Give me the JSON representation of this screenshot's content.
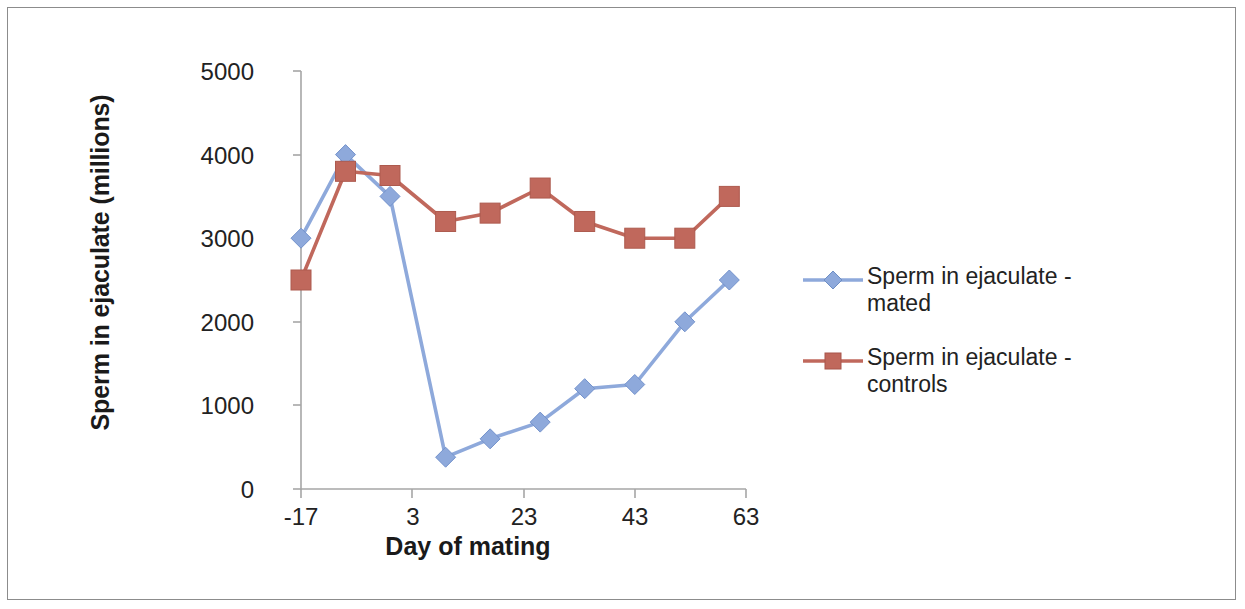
{
  "chart_data": {
    "type": "line",
    "title": "",
    "xlabel": "Day of mating",
    "ylabel": "Sperm in ejaculate (millions)",
    "xlim": [
      -17,
      63
    ],
    "ylim": [
      0,
      5000
    ],
    "xticks": [
      "-17",
      "3",
      "23",
      "43",
      "63"
    ],
    "xtick_values": [
      -17,
      3,
      23,
      43,
      63
    ],
    "yticks": [
      "0",
      "1000",
      "2000",
      "3000",
      "4000",
      "5000"
    ],
    "ytick_values": [
      0,
      1000,
      2000,
      3000,
      4000,
      5000
    ],
    "grid": false,
    "legend_position": "right",
    "series": [
      {
        "name": "Sperm in ejaculate  -  mated",
        "color": "#8ea9db",
        "marker": "diamond",
        "x": [
          -17,
          -9,
          -1,
          9,
          17,
          26,
          34,
          43,
          52,
          60
        ],
        "values": [
          3000,
          4000,
          3500,
          380,
          600,
          800,
          1200,
          1250,
          2000,
          2500
        ]
      },
      {
        "name": "Sperm in ejaculate  -  controls",
        "color": "#c0685c",
        "marker": "square",
        "x": [
          -17,
          -9,
          -1,
          9,
          17,
          26,
          34,
          43,
          52,
          60
        ],
        "values": [
          2500,
          3800,
          3750,
          3200,
          3300,
          3600,
          3200,
          3000,
          3000,
          3500
        ]
      }
    ]
  },
  "legend": {
    "items": [
      {
        "label_line1": "Sperm in ejaculate  -",
        "label_line2": "mated",
        "color": "#8ea9db",
        "marker": "diamond"
      },
      {
        "label_line1": "Sperm in ejaculate  -",
        "label_line2": "controls",
        "color": "#c0685c",
        "marker": "square"
      }
    ]
  },
  "axes": {
    "y_title": "Sperm in ejaculate (millions)",
    "x_title": "Day of mating",
    "y_labels": [
      "5000",
      "4000",
      "3000",
      "2000",
      "1000",
      "0"
    ],
    "x_labels": [
      "-17",
      "3",
      "23",
      "43",
      "63"
    ]
  },
  "colors": {
    "series_mated": "#8ea9db",
    "series_controls": "#c0685c",
    "axis": "#a6a6a6",
    "text": "#222222",
    "border": "#8c8c8c",
    "background": "#ffffff"
  }
}
